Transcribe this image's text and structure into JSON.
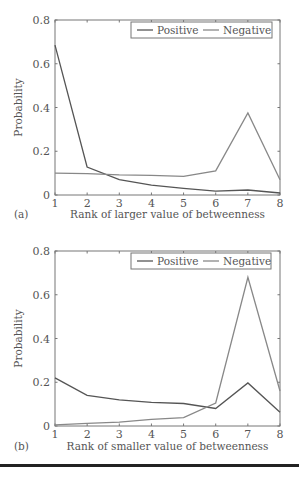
{
  "chart_data": [
    {
      "type": "line",
      "panel_label": "(a)",
      "title": "",
      "xlabel": "Rank of larger value of betweenness",
      "ylabel": "Probability",
      "x": [
        1,
        2,
        3,
        4,
        5,
        6,
        7,
        8
      ],
      "xticks": [
        "1",
        "2",
        "3",
        "4",
        "5",
        "6",
        "7",
        "8"
      ],
      "yticks": [
        "0",
        "0.2",
        "0.4",
        "0.6",
        "0.8"
      ],
      "xlim": [
        1,
        8
      ],
      "ylim": [
        0,
        0.8
      ],
      "grid": false,
      "legend_position": "upper right",
      "series": [
        {
          "name": "Positive",
          "color": "#555555",
          "values": [
            0.685,
            0.128,
            0.07,
            0.045,
            0.03,
            0.018,
            0.023,
            0.009
          ]
        },
        {
          "name": "Negative",
          "color": "#888888",
          "values": [
            0.1,
            0.098,
            0.092,
            0.09,
            0.085,
            0.11,
            0.375,
            0.07
          ]
        }
      ]
    },
    {
      "type": "line",
      "panel_label": "(b)",
      "title": "",
      "xlabel": "Rank of smaller value of betweenness",
      "ylabel": "Probability",
      "x": [
        1,
        2,
        3,
        4,
        5,
        6,
        7,
        8
      ],
      "xticks": [
        "1",
        "2",
        "3",
        "4",
        "5",
        "6",
        "7",
        "8"
      ],
      "yticks": [
        "0",
        "0.2",
        "0.4",
        "0.6",
        "0.8"
      ],
      "xlim": [
        1,
        8
      ],
      "ylim": [
        0,
        0.8
      ],
      "grid": false,
      "legend_position": "upper right",
      "series": [
        {
          "name": "Positive",
          "color": "#555555",
          "values": [
            0.22,
            0.14,
            0.12,
            0.108,
            0.103,
            0.08,
            0.197,
            0.063
          ]
        },
        {
          "name": "Negative",
          "color": "#888888",
          "values": [
            0.005,
            0.012,
            0.018,
            0.03,
            0.038,
            0.105,
            0.68,
            0.16
          ]
        }
      ]
    }
  ]
}
